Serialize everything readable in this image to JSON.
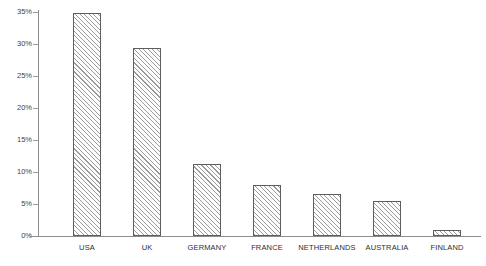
{
  "chart_data": {
    "type": "bar",
    "title": "",
    "xlabel": "",
    "ylabel": "",
    "categories": [
      "USA",
      "UK",
      "GERMANY",
      "FRANCE",
      "NETHERLANDS",
      "AUSTRALIA",
      "FINLAND"
    ],
    "values": [
      34.8,
      29.4,
      11.3,
      8.0,
      6.6,
      5.4,
      0.9
    ],
    "ylim": [
      0,
      35
    ],
    "yticks": [
      0,
      5,
      10,
      15,
      20,
      25,
      30,
      35
    ],
    "ytick_labels": [
      "0%",
      "5%",
      "10%",
      "15%",
      "20%",
      "25%",
      "30%",
      "35%"
    ],
    "grid": false,
    "legend": null,
    "bar_style": {
      "fill": "#fdfdfd",
      "hatch": "diagonal-forward",
      "hatch_color": "#9b9b9b",
      "edge_color": "#5e5e5e"
    },
    "axis_color": "#8d8d8d",
    "text_color": "#2e2e2e"
  }
}
